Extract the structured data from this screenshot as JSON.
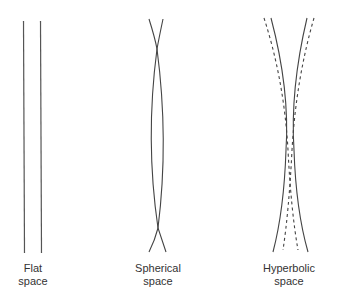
{
  "panels": [
    {
      "id": "flat",
      "label_line1": "Flat",
      "label_line2": "space",
      "description": "Two parallel straight lines"
    },
    {
      "id": "spherical",
      "label_line1": "Spherical",
      "label_line2": "space",
      "description": "Two lines that cross near top and bottom, bulging apart in the middle"
    },
    {
      "id": "hyperbolic",
      "label_line1": "Hyperbolic",
      "label_line2": "space",
      "description": "Two solid lines that converge toward the middle and diverge at the ends, with two dashed lines crossing"
    }
  ],
  "colors": {
    "line": "#444444",
    "text": "#333333",
    "background": "#ffffff"
  }
}
